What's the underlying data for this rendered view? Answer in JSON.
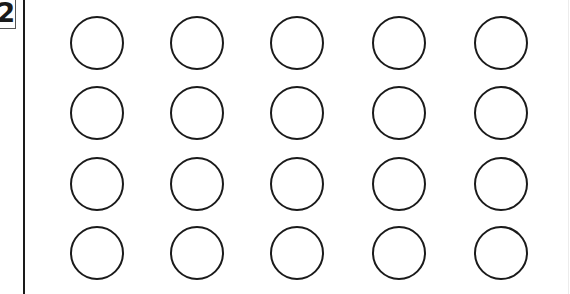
{
  "worksheet": {
    "problem_number": "2",
    "grid": {
      "rows": 4,
      "columns": 5,
      "shape": "circle",
      "fill": "empty",
      "stroke_color": "#1a1a1a",
      "column_centers_x": [
        96,
        196,
        296,
        398,
        500
      ],
      "row_centers_y": [
        42,
        112,
        183,
        252
      ],
      "radius": 26
    }
  }
}
